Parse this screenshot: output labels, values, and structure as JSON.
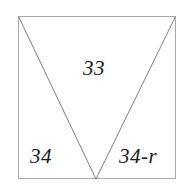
{
  "figure": {
    "kind": "geometry-diagram",
    "background_color": "#ffffff",
    "outline_color": "#a8a8a8",
    "divider_color": "#7f7f7f",
    "text_color": "#1a1a1a",
    "square": {
      "left": 18,
      "top": 16,
      "right": 176,
      "bottom": 179,
      "stroke_width": 1
    },
    "apex": {
      "x": 96,
      "y": 179
    },
    "regions": [
      {
        "name": "top-region",
        "label": "33",
        "shape": "triangle",
        "vertices": "(18,16) (176,16) (96,179)"
      },
      {
        "name": "left-region",
        "label": "34",
        "shape": "triangle",
        "vertices": "(18,16) (18,179) (96,179)"
      },
      {
        "name": "right-region",
        "label": "34-r",
        "shape": "triangle",
        "vertices": "(176,16) (176,179) (96,179)"
      }
    ]
  }
}
